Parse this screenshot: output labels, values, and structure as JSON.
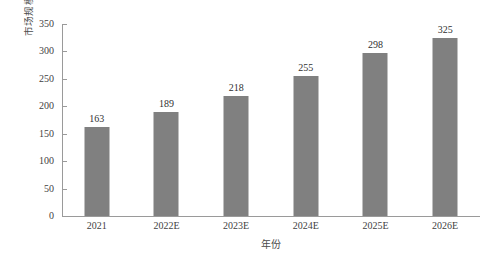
{
  "chart_data": {
    "type": "bar",
    "title": "",
    "subtitle": "",
    "xlabel": "年份",
    "ylabel": "市场规模/亿元",
    "categories": [
      "2021",
      "2022E",
      "2023E",
      "2024E",
      "2025E",
      "2026E"
    ],
    "values": [
      163,
      189,
      218,
      255,
      298,
      325
    ],
    "series": [
      {
        "name": "市场规模",
        "values": [
          163,
          189,
          218,
          255,
          298,
          325
        ]
      }
    ],
    "value_labels": [
      "163",
      "189",
      "218",
      "255",
      "298",
      "325"
    ],
    "ylim": [
      0,
      350
    ],
    "ytick_values": [
      0,
      50,
      100,
      150,
      200,
      250,
      300,
      350
    ],
    "ytick_labels": [
      "0",
      "50",
      "100",
      "150",
      "200",
      "250",
      "300",
      "350"
    ],
    "grid": false,
    "legend": false,
    "legend_position": "none",
    "bar_color": "#808080",
    "axis_color": "#9a9a9a",
    "background_color": "#ffffff",
    "text_color": "#3f3f3f"
  }
}
